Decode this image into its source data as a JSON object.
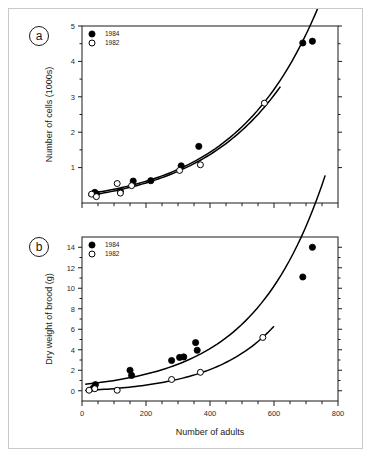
{
  "figure": {
    "panel_a_label": "a",
    "panel_b_label": "b"
  },
  "chart_data": [
    {
      "type": "scatter",
      "panel": "a",
      "title": "",
      "xlabel": "",
      "ylabel": "Number of cells (1000s)",
      "xlim": [
        0,
        800
      ],
      "ylim": [
        0,
        5
      ],
      "xticks": [
        0,
        100,
        200,
        300,
        400,
        500,
        600,
        700,
        800
      ],
      "xticklabels": [
        "",
        "",
        "",
        "",
        "",
        "",
        "",
        "",
        ""
      ],
      "yticks": [
        1,
        2,
        3,
        4,
        5
      ],
      "yticklabels": [
        "1",
        "2",
        "3",
        "4",
        "5"
      ],
      "grid": false,
      "legend_position": "top-left",
      "series": [
        {
          "name": "1984",
          "marker": "filled-circle",
          "points": [
            {
              "x": 40,
              "y": 0.3
            },
            {
              "x": 45,
              "y": 0.26
            },
            {
              "x": 120,
              "y": 0.33
            },
            {
              "x": 160,
              "y": 0.62
            },
            {
              "x": 215,
              "y": 0.63
            },
            {
              "x": 310,
              "y": 1.05
            },
            {
              "x": 365,
              "y": 1.6
            },
            {
              "x": 690,
              "y": 4.52
            },
            {
              "x": 720,
              "y": 4.57
            }
          ],
          "fit": {
            "type": "exponential",
            "x_start": 20,
            "x_end": 740
          }
        },
        {
          "name": "1982",
          "marker": "open-circle",
          "points": [
            {
              "x": 30,
              "y": 0.25
            },
            {
              "x": 45,
              "y": 0.18
            },
            {
              "x": 110,
              "y": 0.55
            },
            {
              "x": 120,
              "y": 0.28
            },
            {
              "x": 155,
              "y": 0.49
            },
            {
              "x": 305,
              "y": 0.92
            },
            {
              "x": 370,
              "y": 1.08
            },
            {
              "x": 570,
              "y": 2.82
            }
          ],
          "fit": {
            "type": "exponential",
            "x_start": 20,
            "x_end": 620
          }
        }
      ]
    },
    {
      "type": "scatter",
      "panel": "b",
      "title": "",
      "xlabel": "Number of adults",
      "ylabel": "Dry weight of brood (g)",
      "xlim": [
        0,
        800
      ],
      "ylim": [
        -1,
        15
      ],
      "xticks": [
        0,
        100,
        200,
        300,
        400,
        500,
        600,
        700,
        800
      ],
      "xticklabels": [
        "0",
        "",
        "200",
        "",
        "400",
        "",
        "600",
        "",
        "800"
      ],
      "yticks": [
        0,
        2,
        4,
        6,
        8,
        10,
        12,
        14
      ],
      "yticklabels": [
        "0",
        "2",
        "4",
        "6",
        "8",
        "10",
        "12",
        "14"
      ],
      "grid": false,
      "legend_position": "top-left",
      "series": [
        {
          "name": "1984",
          "marker": "filled-circle",
          "points": [
            {
              "x": 35,
              "y": 0.25
            },
            {
              "x": 42,
              "y": 0.6
            },
            {
              "x": 150,
              "y": 2.0
            },
            {
              "x": 155,
              "y": 1.5
            },
            {
              "x": 280,
              "y": 2.95
            },
            {
              "x": 305,
              "y": 3.25
            },
            {
              "x": 318,
              "y": 3.3
            },
            {
              "x": 355,
              "y": 4.7
            },
            {
              "x": 360,
              "y": 3.95
            },
            {
              "x": 690,
              "y": 11.1
            },
            {
              "x": 720,
              "y": 14.0
            }
          ],
          "fit": {
            "type": "exponential",
            "x_start": 10,
            "x_end": 760
          }
        },
        {
          "name": "1982",
          "marker": "open-circle",
          "points": [
            {
              "x": 22,
              "y": 0.05
            },
            {
              "x": 40,
              "y": 0.2
            },
            {
              "x": 110,
              "y": 0.05
            },
            {
              "x": 280,
              "y": 1.1
            },
            {
              "x": 370,
              "y": 1.8
            },
            {
              "x": 565,
              "y": 5.2
            }
          ],
          "fit": {
            "type": "exponential",
            "x_start": 10,
            "x_end": 600
          }
        }
      ]
    }
  ]
}
